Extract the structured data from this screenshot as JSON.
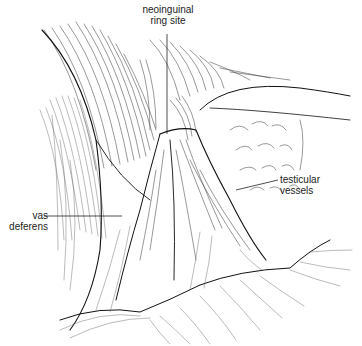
{
  "figure": {
    "labels": {
      "neoinguinal_ring_site": {
        "line1": "neoinguinal",
        "line2": "ring site"
      },
      "vas_deferens": {
        "line1": "vas",
        "line2": "deferens"
      },
      "testicular_vessels": {
        "line1": "testicular",
        "line2": "vessels"
      }
    },
    "colors": {
      "ink": "#111111",
      "background": "#ffffff"
    }
  }
}
